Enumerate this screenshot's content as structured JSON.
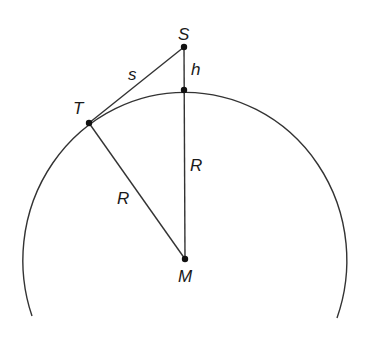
{
  "diagram": {
    "type": "geometry",
    "colors": {
      "stroke": "#333333",
      "point": "#111111",
      "text": "#1a1a1a",
      "background": "#ffffff"
    },
    "points": {
      "S": {
        "label": "S",
        "x": 184,
        "y": 47
      },
      "T": {
        "label": "T",
        "x": 89,
        "y": 123
      },
      "M": {
        "label": "M",
        "x": 185,
        "y": 259
      },
      "P": {
        "label": "",
        "x": 184,
        "y": 90
      }
    },
    "circle": {
      "cx": 185,
      "cy": 258,
      "rx": 162,
      "ry": 168,
      "arc_start": {
        "x": 32,
        "y": 316
      },
      "arc_end": {
        "x": 337,
        "y": 318
      }
    },
    "segments": [
      {
        "name": "tangent-s",
        "from": "S",
        "to": "T",
        "label": "s"
      },
      {
        "name": "height-h",
        "from": "S",
        "to": "P",
        "label": "h"
      },
      {
        "name": "radius-vertical",
        "from": "P",
        "to": "M",
        "label": "R"
      },
      {
        "name": "radius-to-T",
        "from": "T",
        "to": "M",
        "label": "R"
      }
    ],
    "labels": {
      "S": "S",
      "T": "T",
      "M": "M",
      "s": "s",
      "h": "h",
      "R_vertical": "R",
      "R_diagonal": "R"
    }
  }
}
